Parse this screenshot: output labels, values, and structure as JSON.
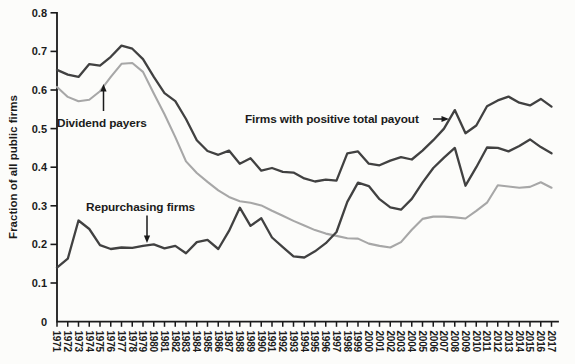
{
  "colors": {
    "line_dark": "#414141",
    "line_gray": "#a7a7a7",
    "axis": "#1a1a1a",
    "text": "#1b1b1b",
    "background": "#fcfcfa"
  },
  "chart_data": {
    "type": "line",
    "title": "",
    "xlabel": "",
    "ylabel": "Fraction of all public firms",
    "xlim": [
      1971,
      2017
    ],
    "ylim": [
      0,
      0.8
    ],
    "grid": false,
    "legend_position": "inline-annotations",
    "x": [
      1971,
      1972,
      1973,
      1974,
      1975,
      1976,
      1977,
      1978,
      1979,
      1980,
      1981,
      1982,
      1983,
      1984,
      1985,
      1986,
      1987,
      1988,
      1989,
      1990,
      1991,
      1992,
      1993,
      1994,
      1995,
      1996,
      1997,
      1998,
      1999,
      2000,
      2001,
      2002,
      2003,
      2004,
      2005,
      2006,
      2007,
      2008,
      2009,
      2010,
      2011,
      2012,
      2013,
      2014,
      2015,
      2016,
      2017
    ],
    "x_tick_labels": [
      "1971",
      "1972",
      "1973",
      "1974",
      "1975",
      "1976",
      "1977",
      "1978",
      "1979",
      "1980",
      "1981",
      "1982",
      "1983",
      "1984",
      "1985",
      "1986",
      "1987",
      "1988",
      "1989",
      "1990",
      "1991",
      "1992",
      "1993",
      "1994",
      "1995",
      "1996",
      "1997",
      "1998",
      "1999",
      "2000",
      "2001",
      "2002",
      "2003",
      "2004",
      "2005",
      "2006",
      "2007",
      "2008",
      "2009",
      "2010",
      "2011",
      "2012",
      "2013",
      "2014",
      "2015",
      "2016",
      "2017"
    ],
    "y_ticks": [
      0,
      0.1,
      0.2,
      0.3,
      0.4,
      0.5,
      0.6,
      0.7,
      0.8
    ],
    "y_tick_labels": [
      "0",
      "0.1",
      "0.2",
      "0.3",
      "0.4",
      "0.5",
      "0.6",
      "0.7",
      "0.8"
    ],
    "series": [
      {
        "name": "Dividend payers",
        "color": "#a7a7a7",
        "values": [
          0.608,
          0.582,
          0.571,
          0.575,
          0.597,
          0.634,
          0.668,
          0.67,
          0.647,
          0.591,
          0.537,
          0.478,
          0.415,
          0.385,
          0.362,
          0.34,
          0.323,
          0.312,
          0.308,
          0.301,
          0.287,
          0.274,
          0.261,
          0.249,
          0.237,
          0.228,
          0.222,
          0.216,
          0.215,
          0.202,
          0.196,
          0.192,
          0.206,
          0.238,
          0.266,
          0.272,
          0.272,
          0.27,
          0.267,
          0.287,
          0.308,
          0.353,
          0.35,
          0.347,
          0.349,
          0.361,
          0.347
        ]
      },
      {
        "name": "Repurchasing firms",
        "color": "#414141",
        "values": [
          0.14,
          0.163,
          0.262,
          0.24,
          0.198,
          0.188,
          0.192,
          0.191,
          0.196,
          0.2,
          0.19,
          0.196,
          0.177,
          0.206,
          0.212,
          0.188,
          0.235,
          0.295,
          0.248,
          0.268,
          0.218,
          0.193,
          0.169,
          0.166,
          0.182,
          0.203,
          0.232,
          0.31,
          0.36,
          0.351,
          0.317,
          0.296,
          0.29,
          0.318,
          0.36,
          0.398,
          0.425,
          0.45,
          0.352,
          0.4,
          0.451,
          0.45,
          0.441,
          0.455,
          0.472,
          0.452,
          0.436
        ]
      },
      {
        "name": "Firms with positive total payout",
        "color": "#414141",
        "values": [
          0.652,
          0.64,
          0.634,
          0.667,
          0.663,
          0.686,
          0.715,
          0.707,
          0.68,
          0.634,
          0.592,
          0.571,
          0.525,
          0.47,
          0.442,
          0.432,
          0.443,
          0.409,
          0.423,
          0.391,
          0.398,
          0.388,
          0.386,
          0.371,
          0.363,
          0.368,
          0.365,
          0.436,
          0.441,
          0.409,
          0.405,
          0.417,
          0.426,
          0.42,
          0.443,
          0.47,
          0.5,
          0.548,
          0.488,
          0.508,
          0.558,
          0.573,
          0.583,
          0.567,
          0.56,
          0.577,
          0.557
        ]
      }
    ],
    "annotations": [
      {
        "text": "Dividend payers",
        "arrow": "up",
        "target_year": 1975,
        "target_value": 0.6
      },
      {
        "text": "Repurchasing firms",
        "arrow": "down",
        "target_year": 1979,
        "target_value": 0.196
      },
      {
        "text": "Firms with positive total payout",
        "arrow": "right",
        "target_year": 2008,
        "target_value": 0.52
      }
    ]
  }
}
